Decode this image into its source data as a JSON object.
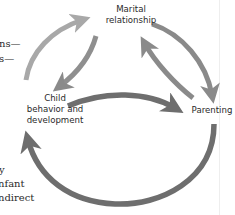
{
  "diagram": {
    "nodes": {
      "marital": {
        "line1": "Marital",
        "line2": "relationship"
      },
      "child": {
        "line1": "Child",
        "line2": "behavior and",
        "line3": "development"
      },
      "parenting": {
        "line1": "Parenting"
      }
    },
    "edges": [
      {
        "from": "child",
        "to": "marital",
        "style": "light-gray"
      },
      {
        "from": "marital",
        "to": "child",
        "style": "medium-gray"
      },
      {
        "from": "marital",
        "to": "parenting",
        "style": "medium-gray"
      },
      {
        "from": "parenting",
        "to": "marital",
        "style": "medium-gray"
      },
      {
        "from": "child",
        "to": "parenting",
        "style": "dark-gray"
      },
      {
        "from": "parenting",
        "to": "child",
        "style": "dark-gray"
      }
    ],
    "colors": {
      "light_arrow": "#a8a8a8",
      "medium_arrow": "#8a8a8a",
      "dark_arrow": "#6e6e6e",
      "label_text": "#2a2a2a"
    }
  },
  "surrounding_text": {
    "line1": "ns—",
    "line2": "s—",
    "line3": "y",
    "line4": "nfant",
    "line5": "ndirect"
  }
}
